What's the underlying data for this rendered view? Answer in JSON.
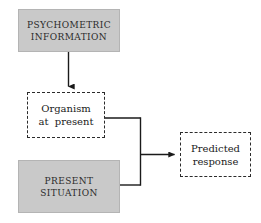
{
  "diagram": {
    "canvas": {
      "width": 261,
      "height": 223
    },
    "colors": {
      "box_fill_gray": "#c9c9c9",
      "box_fill_gray_border": "#b4b4b4",
      "dashed_border": "#2b2b2b",
      "connector": "#1a1a1a",
      "background": "#ffffff",
      "text": "#1a1a1a"
    },
    "nodes": [
      {
        "id": "psychometric-information",
        "style": "filled-gray",
        "line1": "PSYCHOMETRIC",
        "line2": "INFORMATION"
      },
      {
        "id": "organism-at-present",
        "style": "dashed",
        "line1": "Organism",
        "line2": "at  present"
      },
      {
        "id": "present-situation",
        "style": "filled-gray",
        "line1": "PRESENT",
        "line2": "SITUATION"
      },
      {
        "id": "predicted-response",
        "style": "dashed",
        "line1": "Predicted",
        "line2": "response"
      }
    ],
    "edges": [
      {
        "id": "edge-psychometric-to-organism",
        "from": "psychometric-information",
        "to": "organism-at-present",
        "arrowhead": true,
        "orientation": "vertical"
      },
      {
        "id": "edge-organism-to-predicted",
        "from": "organism-at-present",
        "to": "predicted-response",
        "arrowhead": true,
        "orientation": "orthogonal"
      },
      {
        "id": "edge-situation-to-predicted",
        "from": "present-situation",
        "to": "predicted-response",
        "arrowhead": true,
        "orientation": "orthogonal"
      }
    ]
  }
}
